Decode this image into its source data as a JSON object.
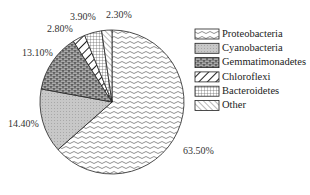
{
  "chart_data": {
    "type": "pie",
    "title": "",
    "start_angle": "12 o'clock",
    "direction": "clockwise",
    "categories": [
      "Proteobacteria",
      "Cyanobacteria",
      "Gemmatimonadetes",
      "Chloroflexi",
      "Bacteroidetes",
      "Other"
    ],
    "values": [
      63.5,
      14.4,
      13.1,
      2.8,
      3.9,
      2.3
    ],
    "labels": [
      "63.50%",
      "14.40%",
      "13.10%",
      "2.80%",
      "3.90%",
      "2.30%"
    ],
    "patterns": [
      "wavy",
      "gray-dots",
      "dark-brick",
      "diagonal-hatch-wide",
      "grid",
      "diagonal-hatch-narrow"
    ],
    "slice_order_clockwise_from_top": [
      "Proteobacteria",
      "Cyanobacteria",
      "Gemmatimonadetes",
      "Chloroflexi",
      "Bacteroidetes",
      "Other"
    ],
    "legend_position": "right",
    "legend": [
      "Proteobacteria",
      "Cyanobacteria",
      "Gemmatimonadetes",
      "Chloroflexi",
      "Bacteroidetes",
      "Other"
    ]
  },
  "labels": {
    "proteobacteria": "63.50%",
    "cyanobacteria": "14.40%",
    "gemmatimonadetes": "13.10%",
    "chloroflexi": "2.80%",
    "bacteroidetes": "3.90%",
    "other": "2.30%"
  },
  "legend": {
    "items": [
      {
        "label": "Proteobacteria"
      },
      {
        "label": "Cyanobacteria"
      },
      {
        "label": "Gemmatimonadetes"
      },
      {
        "label": "Chloroflexi"
      },
      {
        "label": "Bacteroidetes"
      },
      {
        "label": "Other"
      }
    ]
  }
}
